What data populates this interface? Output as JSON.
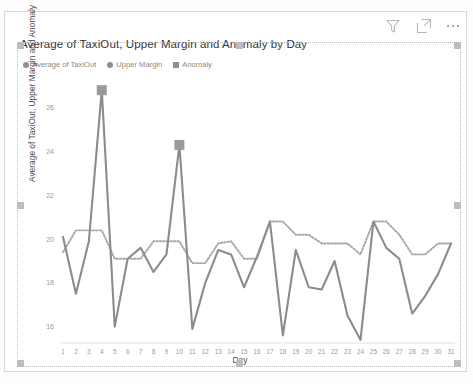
{
  "visual": {
    "title": "Average of TaxiOut, Upper Margin and Anomaly by Day",
    "header_icons": [
      {
        "name": "filter-icon",
        "label": "Filters"
      },
      {
        "name": "focus-mode-icon",
        "label": "Focus mode"
      },
      {
        "name": "more-options-icon",
        "label": "More options"
      }
    ]
  },
  "legend": {
    "position": "top-left",
    "items": [
      {
        "label": "Average of TaxiOut",
        "marker": "circle",
        "color": "#8f8f8f"
      },
      {
        "label": "Upper Margin",
        "marker": "circle",
        "color": "#8f8f8f"
      },
      {
        "label": "Anomaly",
        "marker": "square",
        "color": "#8f8f8f"
      }
    ]
  },
  "chart_data": {
    "type": "line",
    "title": "Average of TaxiOut, Upper Margin and Anomaly by Day",
    "xlabel": "Day",
    "ylabel": "Average of TaxiOut, Upper Margin and Anomaly",
    "x": [
      1,
      2,
      3,
      4,
      5,
      6,
      7,
      8,
      9,
      10,
      11,
      12,
      13,
      14,
      15,
      16,
      17,
      18,
      19,
      20,
      21,
      22,
      23,
      24,
      25,
      26,
      27,
      28,
      29,
      30,
      31
    ],
    "xlim": [
      1,
      31
    ],
    "ylim": [
      15.3,
      26.9
    ],
    "yticks": [
      16,
      18,
      20,
      22,
      24,
      26
    ],
    "xticks": [
      "1",
      "2",
      "3",
      "4",
      "5",
      "6",
      "7",
      "8",
      "9",
      "10",
      "11",
      "12",
      "13",
      "14",
      "15",
      "16",
      "17",
      "18",
      "19",
      "20",
      "21",
      "22",
      "23",
      "24",
      "25",
      "26",
      "27",
      "28",
      "29",
      "30",
      "31"
    ],
    "grid": false,
    "legend_position": "top-left",
    "series": [
      {
        "name": "Average of TaxiOut",
        "style": "solid",
        "color": "#8c8c8c",
        "values": [
          20.1,
          17.5,
          19.9,
          26.8,
          16.0,
          19.1,
          19.6,
          18.5,
          19.3,
          24.3,
          15.9,
          18.0,
          19.5,
          19.3,
          17.8,
          19.2,
          20.8,
          15.6,
          19.5,
          17.8,
          17.7,
          19.0,
          16.5,
          15.4,
          20.8,
          19.6,
          19.1,
          16.6,
          17.4,
          18.4,
          19.8
        ]
      },
      {
        "name": "Upper Margin",
        "style": "dotted",
        "color": "#a6a6a6",
        "values": [
          19.4,
          20.4,
          20.4,
          20.4,
          19.1,
          19.1,
          19.1,
          19.9,
          19.9,
          19.9,
          18.9,
          18.9,
          19.8,
          19.9,
          19.1,
          19.1,
          20.8,
          20.8,
          20.2,
          20.2,
          19.8,
          19.8,
          19.8,
          19.3,
          20.8,
          20.8,
          20.2,
          19.3,
          19.3,
          19.8,
          19.8
        ]
      },
      {
        "name": "Anomaly",
        "style": "marker",
        "marker": "square",
        "color": "#9a9a9a",
        "points": [
          {
            "x": 4,
            "y": 26.8
          },
          {
            "x": 10,
            "y": 24.3
          }
        ]
      }
    ]
  }
}
